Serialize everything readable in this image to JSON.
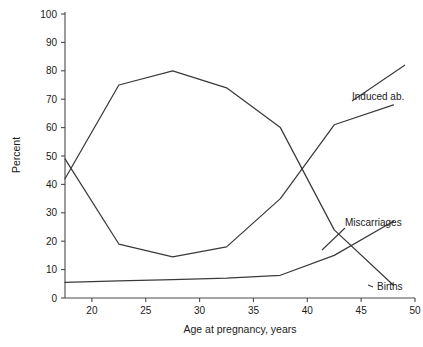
{
  "chart_data": {
    "type": "line",
    "title": "",
    "xlabel": "Age at pregnancy, years",
    "ylabel": "Percent",
    "xlim": [
      17.5,
      50
    ],
    "ylim": [
      0,
      100
    ],
    "grid": false,
    "legend_position": "inline-right-end-labels",
    "xticks": [
      "20",
      "25",
      "30",
      "35",
      "40",
      "45",
      "50"
    ],
    "xtick_values": [
      20,
      25,
      30,
      35,
      40,
      45,
      50
    ],
    "yticks": [
      "0",
      "10",
      "20",
      "30",
      "40",
      "50",
      "60",
      "70",
      "80",
      "90",
      "100"
    ],
    "ytick_values": [
      0,
      10,
      20,
      30,
      40,
      50,
      60,
      70,
      80,
      90,
      100
    ],
    "x": [
      17.5,
      22.5,
      27.5,
      32.5,
      37.5,
      42.5,
      48
    ],
    "series": [
      {
        "name": "Induced ab.",
        "label": "Induced ab.",
        "values": [
          49,
          19,
          14.5,
          18,
          35,
          61,
          68
        ],
        "color": "#3a3a3a"
      },
      {
        "name": "Births",
        "label": "Births",
        "values": [
          42,
          75,
          80,
          74,
          60,
          24,
          4.5
        ],
        "color": "#3a3a3a"
      },
      {
        "name": "Miscarriages",
        "label": "Miscarriages",
        "values": [
          5.5,
          6,
          6.5,
          7,
          8,
          15,
          27
        ],
        "color": "#3a3a3a"
      }
    ]
  },
  "axes": {
    "y_title": "Percent",
    "x_title": "Age at pregnancy, years"
  },
  "labels": {
    "induced": "Induced ab.",
    "miscarriages": "Miscarriages",
    "births": "Births"
  }
}
